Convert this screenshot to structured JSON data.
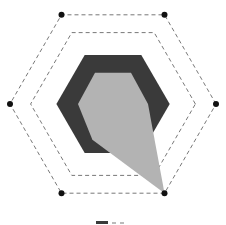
{
  "chart_data": {
    "type": "radar",
    "title": "",
    "axes": [
      "right",
      "top-right",
      "top-left",
      "left",
      "bottom-left",
      "bottom-right"
    ],
    "axis_labels_visible": false,
    "rlim": [
      0,
      100
    ],
    "grid_levels": [
      80,
      100
    ],
    "grid_style": "dashed hexagon",
    "series": [
      {
        "name": "Series A",
        "color": "#3a3a3a",
        "values": [
          55,
          55,
          55,
          55,
          55,
          55
        ]
      },
      {
        "name": "Series B",
        "color": "#b3b3b3",
        "values": [
          34,
          35,
          35,
          34,
          40,
          100
        ]
      }
    ],
    "vertex_markers": true,
    "legend": {
      "position": "bottom",
      "partially_visible": true
    }
  },
  "layout": {
    "center": [
      113,
      104
    ],
    "radius": 103
  }
}
